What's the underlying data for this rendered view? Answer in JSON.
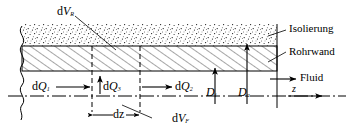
{
  "figure": {
    "language": "de",
    "colors": {
      "line": "#000000",
      "fill": "#ffffff",
      "stipple": "#000000"
    }
  },
  "labels": {
    "dV_R": {
      "d": "d",
      "sym": "V",
      "sub": "R"
    },
    "dV_F": {
      "d": "d",
      "sym": "V",
      "sub": "F"
    },
    "dQ1": {
      "d": "d",
      "sym": "Q",
      "sub": "1"
    },
    "dQ2": {
      "d": "d",
      "sym": "Q",
      "sub": "2"
    },
    "dQ3": {
      "d": "d",
      "sym": "Q",
      "sub": "3"
    },
    "dz": "dz",
    "D_i": {
      "sym": "D",
      "sub": "i"
    },
    "D_a": {
      "sym": "D",
      "sub": "a"
    },
    "z": "z",
    "isolierung": "Isolierung",
    "rohrwand": "Rohrwand",
    "fluid": "Fluid"
  },
  "icons": {
    "arrow_right": "arrow-right-icon",
    "arrow_up": "arrow-up-icon",
    "dimension_arrow": "dimension-arrow-icon",
    "leader_line": "leader-line-icon",
    "break_line": "break-line-icon",
    "centerline": "centerline-icon"
  }
}
